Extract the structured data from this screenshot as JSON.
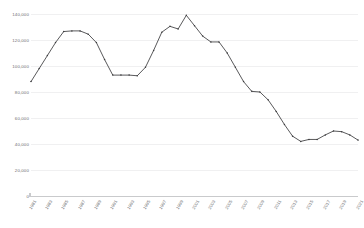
{
  "chart_data": {
    "type": "line",
    "title": "",
    "subtitle": "",
    "xlabel": "",
    "ylabel": "",
    "ylim": [
      0,
      140000
    ],
    "xlim": [
      1981,
      2021
    ],
    "grid": true,
    "legend": false,
    "legend_position": "none",
    "line_color": "#3b3b3d",
    "grid_color": "#f0f0f1",
    "axis_color": "#c9cacc",
    "text_color": "#6d6e71",
    "background_color": "#ffffff",
    "y_ticks": [
      "140,000",
      "120,000",
      "100,000",
      "80,000",
      "60,000",
      "40,000",
      "20,000",
      "0"
    ],
    "y_tick_values": [
      140000,
      120000,
      100000,
      80000,
      60000,
      40000,
      20000,
      0
    ],
    "x_tick_labels": [
      "1981",
      "1983",
      "1985",
      "1987",
      "1989",
      "1991",
      "1993",
      "1995",
      "1997",
      "1999",
      "2001",
      "2003",
      "2005",
      "2007",
      "2009",
      "2011",
      "2013",
      "2015",
      "2017",
      "2019",
      "2021"
    ],
    "categories": [
      "1981",
      "1982",
      "1983",
      "1984",
      "1985",
      "1986",
      "1987",
      "1988",
      "1989",
      "1990",
      "1991",
      "1992",
      "1993",
      "1994",
      "1995",
      "1996",
      "1997",
      "1998",
      "1999",
      "2000",
      "2001",
      "2002",
      "2003",
      "2004",
      "2005",
      "2006",
      "2007",
      "2008",
      "2009",
      "2010",
      "2011",
      "2012",
      "2013",
      "2014",
      "2015",
      "2016",
      "2017",
      "2018",
      "2019",
      "2020",
      "2021"
    ],
    "values": [
      88000,
      98000,
      108000,
      118000,
      126500,
      127000,
      127000,
      124500,
      118000,
      105000,
      93000,
      93000,
      93000,
      92500,
      99000,
      112000,
      126000,
      130500,
      128500,
      139000,
      131000,
      123000,
      118500,
      118500,
      110000,
      99000,
      88000,
      80500,
      80000,
      74000,
      65000,
      55000,
      46000,
      42000,
      43500,
      43500,
      47000,
      50000,
      49500,
      47000,
      43000
    ]
  }
}
